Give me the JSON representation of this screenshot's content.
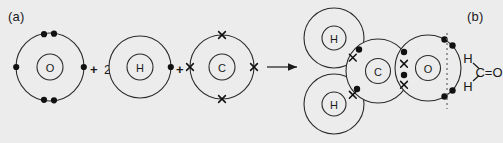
{
  "figure": {
    "panel_a_label": "(a)",
    "panel_b_label": "(b)",
    "coefficient_h": "2",
    "plus_1": "+",
    "plus_2": "+",
    "arrow": "reaction-arrow"
  },
  "reactants": [
    {
      "id": "oxygen",
      "symbol": "O",
      "electron_mark": "dot",
      "valence_electrons": 6,
      "arrangement": "two pairs top, two pairs bottom, one left, one right"
    },
    {
      "id": "hydrogen",
      "symbol": "H",
      "electron_mark": "dot",
      "valence_electrons": 1,
      "arrangement": "one right"
    },
    {
      "id": "carbon",
      "symbol": "C",
      "electron_mark": "cross",
      "valence_electrons": 4,
      "arrangement": "one top, one bottom, one left, one right"
    }
  ],
  "product": {
    "name": "methanal",
    "atoms": [
      {
        "id": "product-h-top",
        "symbol": "H"
      },
      {
        "id": "product-h-bottom",
        "symbol": "H"
      },
      {
        "id": "product-carbon",
        "symbol": "C"
      },
      {
        "id": "product-oxygen",
        "symbol": "O"
      }
    ],
    "bonds": [
      {
        "id": "bond-c-h-top",
        "type": "single",
        "shared": "1 dot + 1 cross"
      },
      {
        "id": "bond-c-h-bottom",
        "type": "single",
        "shared": "1 dot + 1 cross"
      },
      {
        "id": "bond-c-o",
        "type": "double",
        "shared": "2 dots + 2 crosses"
      }
    ],
    "lone_pairs_on_oxygen": 2
  },
  "structural_formula": {
    "h_top": "H",
    "h_bottom": "H",
    "core": "C=O"
  },
  "colors": {
    "background": "#ececec",
    "stroke": "#2b2b2b",
    "electron": "#111111",
    "divider": "#6f6f6f"
  }
}
